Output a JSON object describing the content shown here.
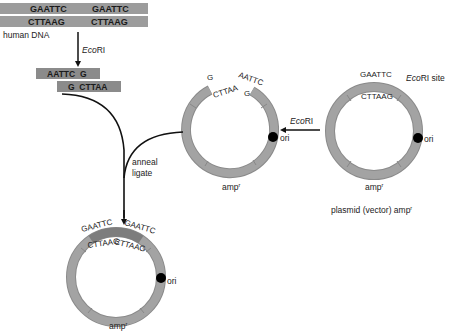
{
  "human_dna": {
    "top_strand": [
      "GAATTC",
      "GAATTC"
    ],
    "bottom_strand": [
      "CTTAAG",
      "CTTAAG"
    ],
    "label": "human DNA"
  },
  "digest_step": {
    "enzyme": "EcoRI",
    "enzyme_italic": "Eco",
    "enzyme_roman": "RI"
  },
  "fragment": {
    "top": "AATTC  G",
    "bottom": "G  CTTAA"
  },
  "cut_plasmid": {
    "left_top": "G",
    "left_bottom": "CTTAA",
    "right_top": "AATTC",
    "right_bottom": "G",
    "ori_label": "ori",
    "amp_label": "amp",
    "amp_sup": "r"
  },
  "vector_step": {
    "enzyme_italic": "Eco",
    "enzyme_roman": "RI"
  },
  "vector_plasmid": {
    "site_top": "GAATTC",
    "site_bottom": "CTTAAG",
    "site_label_italic": "Eco",
    "site_label_roman": "RI site",
    "ori_label": "ori",
    "amp_label": "amp",
    "amp_sup": "r",
    "caption": "plasmid (vector) amp",
    "caption_sup": "r"
  },
  "ligation_step": {
    "line1": "anneal",
    "line2": "ligate"
  },
  "recombinant_plasmid": {
    "left_top": "GAATTC",
    "right_top": "GAATTC",
    "left_bottom": "CTTAAG",
    "right_bottom": "CTTAAG",
    "ori_label": "ori",
    "amp_label": "amp",
    "amp_sup": "r"
  },
  "colors": {
    "ring": "#a3a3a3",
    "ring_edge": "#8a8a8a",
    "insert": "#7d7d7d",
    "strand": "#9c9c9c",
    "strand_dark": "#8b8b8b",
    "arrow": "#111111",
    "ori_dot": "#000000"
  }
}
